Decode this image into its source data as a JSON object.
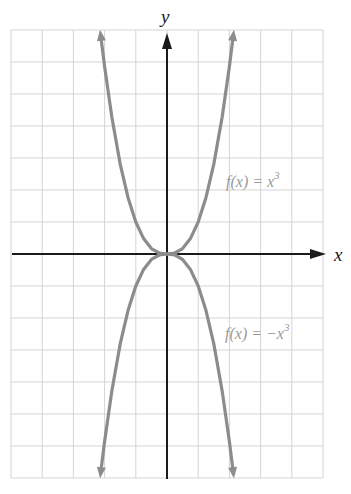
{
  "chart_data": {
    "type": "line",
    "title": "",
    "xlabel": "x",
    "ylabel": "y",
    "grid": true,
    "xlim": [
      -5,
      5
    ],
    "ylim": [
      -7,
      7
    ],
    "x_gridlines": [
      -5,
      -4,
      -3,
      -2,
      -1,
      0,
      1,
      2,
      3,
      4,
      5
    ],
    "y_gridlines": [
      -7,
      -6,
      -5,
      -4,
      -3,
      -2,
      -1,
      0,
      1,
      2,
      3,
      4,
      5,
      6,
      7
    ],
    "series": [
      {
        "name": "f(x) = x^3",
        "label_text": "f(x) = x",
        "label_exponent": "3",
        "color": "#8c8c8c",
        "x": [
          -2.13,
          -2.0,
          -1.77,
          -1.5,
          -1.25,
          -1.0,
          -0.75,
          -0.5,
          -0.25,
          0,
          0.25,
          0.5,
          0.75,
          1.0,
          1.25,
          1.5,
          1.77,
          2.0,
          2.13
        ],
        "y": [
          6.88,
          5.86,
          4.29,
          2.81,
          1.77,
          1.0,
          0.48,
          0.17,
          0.03,
          0,
          0.03,
          0.17,
          0.48,
          1.0,
          1.77,
          2.81,
          4.29,
          5.86,
          6.88
        ],
        "arrows": "both-ends"
      },
      {
        "name": "f(x) = -x^3",
        "label_text": "f(x) = −x",
        "label_exponent": "3",
        "color": "#8c8c8c",
        "x": [
          -2.13,
          -2.0,
          -1.77,
          -1.5,
          -1.25,
          -1.0,
          -0.75,
          -0.5,
          -0.25,
          0,
          0.25,
          0.5,
          0.75,
          1.0,
          1.25,
          1.5,
          1.77,
          2.0,
          2.13
        ],
        "y": [
          -6.88,
          -5.86,
          -4.29,
          -2.81,
          -1.77,
          -1.0,
          -0.48,
          -0.17,
          -0.03,
          0,
          -0.03,
          -0.17,
          -0.48,
          -1.0,
          -1.77,
          -2.81,
          -4.29,
          -5.86,
          -6.88
        ],
        "arrows": "both-ends"
      }
    ],
    "annotations": [
      {
        "text": "f(x) = x³",
        "x": 2.0,
        "y": 2.4
      },
      {
        "text": "f(x) = −x³",
        "x": 1.8,
        "y": -2.6
      }
    ]
  },
  "axes": {
    "x_label": "x",
    "y_label": "y"
  },
  "labels": {
    "upper": {
      "text": "f(x) = x",
      "exp": "3"
    },
    "lower": {
      "text": "f(x) = −x",
      "exp": "3"
    }
  },
  "colors": {
    "grid": "#d4d4d4",
    "axis": "#1a1a1a",
    "curve": "#8c8c8c",
    "label": "#9a9a9a"
  }
}
